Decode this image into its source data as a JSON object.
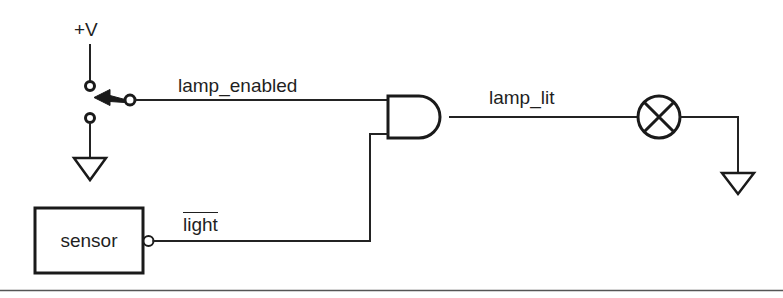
{
  "diagram": {
    "type": "schematic",
    "background_color": "#ffffff",
    "line_color": "#1a1a1a",
    "text_color": "#1f1f1f",
    "labels": {
      "supply": "+V",
      "lamp_enabled": "lamp_enabled",
      "lamp_lit": "lamp_lit",
      "light_inverted": "light",
      "sensor": "sensor"
    },
    "components": [
      {
        "name": "power-supply-label",
        "kind": "supply-rail",
        "label": "+V"
      },
      {
        "name": "spdt-switch",
        "kind": "switch",
        "poles": 1,
        "throws": 2,
        "position": "upper-contact-closed",
        "upper_terminal": "+V",
        "lower_terminal": "ground",
        "output_signal": "lamp_enabled"
      },
      {
        "name": "and-gate",
        "kind": "logic-gate",
        "gate_type": "AND",
        "inputs": [
          "lamp_enabled",
          "light"
        ],
        "input_count": 2,
        "output": "lamp_lit"
      },
      {
        "name": "lamp",
        "kind": "lamp",
        "symbol": "circle-with-cross",
        "driven_by": "lamp_lit",
        "return": "ground"
      },
      {
        "name": "sensor-block",
        "kind": "block",
        "label": "sensor",
        "output_inverted": true,
        "output_signal": "light"
      },
      {
        "name": "ground-switch",
        "kind": "ground",
        "symbol": "triangle"
      },
      {
        "name": "ground-lamp",
        "kind": "ground",
        "symbol": "triangle"
      }
    ],
    "signals": [
      {
        "name": "lamp_enabled",
        "negated": false,
        "from": "spdt-switch",
        "to": "and-gate input A"
      },
      {
        "name": "light",
        "negated": true,
        "from": "sensor-block",
        "to": "and-gate input B"
      },
      {
        "name": "lamp_lit",
        "negated": false,
        "from": "and-gate output",
        "to": "lamp"
      }
    ],
    "footer_rule": true
  }
}
